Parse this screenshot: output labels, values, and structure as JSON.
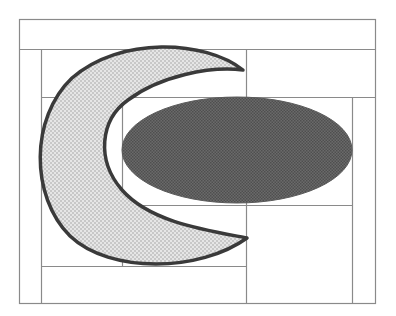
{
  "canvas": {
    "width": 396,
    "height": 316,
    "background": "#ffffff"
  },
  "colors": {
    "grid_line": "#8a8a8a",
    "crescent_fill_a": "#c8c8c8",
    "crescent_fill_b": "#e6e6e6",
    "crescent_stroke": "#3a3a3a",
    "ellipse_fill_a": "#4f4f4f",
    "ellipse_fill_b": "#6a6a6a"
  },
  "grid": {
    "outer_frame": {
      "x": 19,
      "y": 19,
      "w": 356,
      "h": 284
    },
    "lines": [
      {
        "id": "h-top-band",
        "x1": 19,
        "y1": 49,
        "x2": 375,
        "y2": 49
      },
      {
        "id": "v-left-inner",
        "x1": 41,
        "y1": 49,
        "x2": 41,
        "y2": 303
      },
      {
        "id": "h-upper",
        "x1": 41,
        "y1": 97,
        "x2": 375,
        "y2": 97
      },
      {
        "id": "v-center-left",
        "x1": 122,
        "y1": 97,
        "x2": 122,
        "y2": 266
      },
      {
        "id": "v-center",
        "x1": 246,
        "y1": 49,
        "x2": 246,
        "y2": 303
      },
      {
        "id": "h-lower",
        "x1": 122,
        "y1": 205,
        "x2": 352,
        "y2": 205
      },
      {
        "id": "v-right-inner",
        "x1": 352,
        "y1": 97,
        "x2": 352,
        "y2": 303
      },
      {
        "id": "h-bottom-left",
        "x1": 41,
        "y1": 266,
        "x2": 246,
        "y2": 266
      }
    ]
  },
  "shapes": {
    "crescent": {
      "label": "crescent",
      "path": "M 243 70 C 205 40, 120 36, 72 78 C 30 118, 30 196, 70 236 C 110 274, 200 272, 247 238 C 205 230, 150 222, 122 190 C 96 160, 100 120, 128 100 C 160 76, 210 66, 243 70 Z"
    },
    "ellipse": {
      "label": "ellipse",
      "cx": 237,
      "cy": 150,
      "rx": 115,
      "ry": 53
    }
  }
}
